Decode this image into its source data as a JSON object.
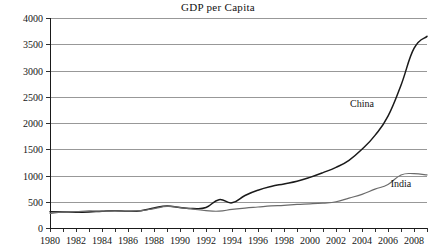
{
  "chart_data": {
    "type": "line",
    "title": "GDP per Capita",
    "xlabel": "",
    "ylabel": "",
    "xlim": [
      1980,
      2009
    ],
    "ylim": [
      0,
      4000
    ],
    "grid": true,
    "legend": "inline-labels",
    "ytick_labels": [
      "0",
      "500",
      "1000",
      "1500",
      "2000",
      "2500",
      "3000",
      "3500",
      "4000"
    ],
    "ytick_values": [
      0,
      500,
      1000,
      1500,
      2000,
      2500,
      3000,
      3500,
      4000
    ],
    "xtick_labels": [
      "1980",
      "1982",
      "1984",
      "1986",
      "1988",
      "1990",
      "1992",
      "1994",
      "1996",
      "1998",
      "2000",
      "2002",
      "2004",
      "2006",
      "2008"
    ],
    "xtick_values": [
      1980,
      1982,
      1984,
      1986,
      1988,
      1990,
      1992,
      1994,
      1996,
      1998,
      2000,
      2002,
      2004,
      2006,
      2008
    ],
    "x": [
      1980,
      1981,
      1982,
      1983,
      1984,
      1985,
      1986,
      1987,
      1988,
      1989,
      1990,
      1991,
      1992,
      1993,
      1994,
      1995,
      1996,
      1997,
      1998,
      1999,
      2000,
      2001,
      2002,
      2003,
      2004,
      2005,
      2006,
      2007,
      2008,
      2009
    ],
    "series": [
      {
        "name": "China",
        "color": "#1a1a1a",
        "stroke_width": 1.5,
        "label_x": 2004,
        "label_y": 2300,
        "values": [
          310,
          305,
          300,
          305,
          320,
          330,
          320,
          330,
          380,
          420,
          390,
          370,
          390,
          540,
          480,
          620,
          720,
          790,
          840,
          890,
          965,
          1055,
          1155,
          1290,
          1500,
          1765,
          2130,
          2720,
          3420,
          3650
        ]
      },
      {
        "name": "India",
        "color": "#6b6b6b",
        "stroke_width": 1.2,
        "label_x": 2007,
        "label_y": 790,
        "values": [
          280,
          300,
          310,
          325,
          320,
          325,
          320,
          330,
          370,
          410,
          390,
          360,
          330,
          320,
          355,
          380,
          400,
          420,
          430,
          450,
          460,
          475,
          500,
          570,
          640,
          740,
          830,
          1010,
          1035,
          1010
        ]
      }
    ],
    "annotations": [
      {
        "text": "China",
        "x": 2004,
        "y": 2300
      },
      {
        "text": "India",
        "x": 2007,
        "y": 790
      }
    ]
  },
  "layout": {
    "plot_left": 50,
    "plot_right": 427,
    "plot_top": 18,
    "plot_bottom": 228
  }
}
